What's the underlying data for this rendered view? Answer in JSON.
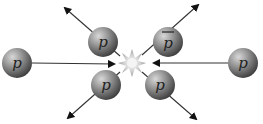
{
  "diagram": {
    "colors": {
      "particle": "#7a7a7a",
      "arrow": "#222222",
      "burst": "#bbbbbb"
    },
    "particles": [
      {
        "id": "incoming-left",
        "label": "p",
        "cx": 17,
        "cy": 63
      },
      {
        "id": "incoming-right",
        "label": "p",
        "cx": 243,
        "cy": 63
      },
      {
        "id": "out-upper-left",
        "label": "p",
        "cx": 103,
        "cy": 42
      },
      {
        "id": "out-lower-left",
        "label": "p",
        "cx": 106,
        "cy": 85
      },
      {
        "id": "out-upper-right",
        "label": "p",
        "bar": true,
        "cx": 168,
        "cy": 42
      },
      {
        "id": "out-lower-right",
        "label": "p",
        "cx": 160,
        "cy": 85
      }
    ]
  }
}
